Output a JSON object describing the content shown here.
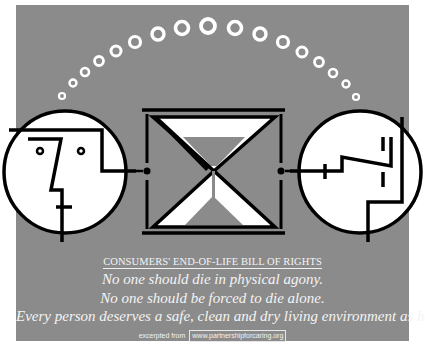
{
  "poster": {
    "background_color": "#8b8b8b",
    "outer_background": "#ffffff",
    "figure_stroke": "#000000",
    "figure_fill": "#ffffff",
    "sand_color": "#8b8b8b"
  },
  "illustration": {
    "rings_count": 17,
    "left_face": "profile-face-left",
    "center": "hourglass",
    "right_face": "profile-face-right"
  },
  "text": {
    "heading": "CONSUMERS' END-OF-LIFE BILL OF RIGHTS",
    "lines": [
      "No one should die in physical agony.",
      "No one should be forced to die alone.",
      "Every person deserves a safe, clean and dry living environment as he or she dies."
    ],
    "footer_prefix": "excerpted from",
    "footer_url": "www.partnershipforcaring.org"
  }
}
